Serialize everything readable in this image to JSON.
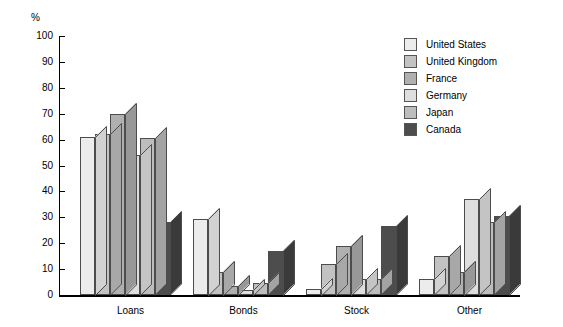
{
  "chart_data": {
    "type": "bar",
    "title": "",
    "subtitle": "",
    "xlabel": "",
    "ylabel": "%",
    "ylim": [
      0,
      100
    ],
    "ytick_step": 10,
    "yticks": [
      "100",
      "90",
      "80",
      "70",
      "60",
      "50",
      "40",
      "30",
      "20",
      "10",
      "0"
    ],
    "grid": false,
    "legend_position": "right",
    "style": "3d-isometric-bars",
    "categories": [
      "Loans",
      "Bonds",
      "Stock",
      "Other"
    ],
    "series": [
      {
        "name": "United States",
        "color": "#ececec",
        "side_color": "#d2d2d2",
        "values": [
          61,
          29.5,
          2.5,
          6
        ]
      },
      {
        "name": "United Kingdom",
        "color": "#c2c2c2",
        "side_color": "#a8a8a8",
        "values": [
          62,
          9,
          12,
          15
        ]
      },
      {
        "name": "France",
        "color": "#b0b0b0",
        "side_color": "#989898",
        "values": [
          70,
          3.5,
          19,
          9
        ]
      },
      {
        "name": "Germany",
        "color": "#dedede",
        "side_color": "#c4c4c4",
        "values": [
          54,
          2,
          6,
          37
        ]
      },
      {
        "name": "Japan",
        "color": "#bdbdbd",
        "side_color": "#a3a3a3",
        "values": [
          60.5,
          4.5,
          6,
          28
        ]
      },
      {
        "name": "Canada",
        "color": "#4d4d4d",
        "side_color": "#3a3a3a",
        "values": [
          28,
          17,
          26.5,
          30.5
        ]
      }
    ]
  },
  "axis": {
    "unit_symbol": "%"
  }
}
